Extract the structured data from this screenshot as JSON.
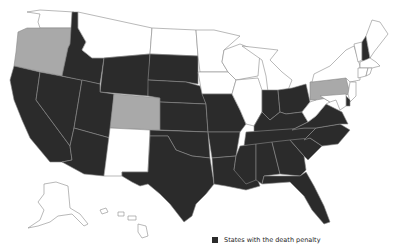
{
  "map": {
    "colors": {
      "death_penalty": "#2b2b2b",
      "moratorium": "#a9a9a9",
      "no_death_penalty": "#ffffff",
      "border": "#8a8a8a"
    },
    "states": {
      "WA": "no_death_penalty",
      "OR": "moratorium",
      "CA": "death_penalty",
      "NV": "death_penalty",
      "ID": "death_penalty",
      "MT": "no_death_penalty",
      "WY": "death_penalty",
      "UT": "death_penalty",
      "AZ": "death_penalty",
      "CO": "moratorium",
      "NM": "no_death_penalty",
      "ND": "no_death_penalty",
      "SD": "death_penalty",
      "NE": "death_penalty",
      "KS": "death_penalty",
      "OK": "death_penalty",
      "TX": "death_penalty",
      "MN": "no_death_penalty",
      "IA": "no_death_penalty",
      "MO": "death_penalty",
      "AR": "death_penalty",
      "LA": "death_penalty",
      "WI": "no_death_penalty",
      "IL": "no_death_penalty",
      "MI": "no_death_penalty",
      "IN": "death_penalty",
      "OH": "death_penalty",
      "KY": "death_penalty",
      "TN": "death_penalty",
      "MS": "death_penalty",
      "AL": "death_penalty",
      "GA": "death_penalty",
      "FL": "death_penalty",
      "SC": "death_penalty",
      "NC": "death_penalty",
      "VA": "death_penalty",
      "WV": "no_death_penalty",
      "PA": "moratorium",
      "NY": "no_death_penalty",
      "VT": "no_death_penalty",
      "NH": "death_penalty",
      "ME": "no_death_penalty",
      "MA": "no_death_penalty",
      "CT": "no_death_penalty",
      "RI": "no_death_penalty",
      "NJ": "no_death_penalty",
      "DE": "death_penalty",
      "MD": "no_death_penalty",
      "AK": "no_death_penalty",
      "HI": "no_death_penalty"
    }
  },
  "legend": {
    "items": [
      {
        "label": "States with the death penalty",
        "color": "#2b2b2b"
      }
    ]
  }
}
